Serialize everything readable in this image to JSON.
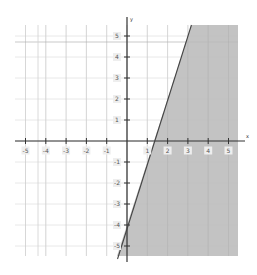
{
  "chart_data": {
    "type": "line",
    "title": "",
    "xlabel": "x",
    "ylabel": "y",
    "xlim": [
      -5.5,
      5.5
    ],
    "ylim": [
      -5.5,
      5.5
    ],
    "grid": true,
    "x_ticks": [
      -5,
      -4,
      -3,
      -2,
      -1,
      1,
      2,
      3,
      4,
      5
    ],
    "y_ticks": [
      5,
      4,
      3,
      2,
      1,
      -1,
      -2,
      -3,
      -4,
      -5
    ],
    "x_tick_labels": [
      "-5",
      "-4",
      "-3",
      "-2",
      "-1",
      "1",
      "2",
      "3",
      "4",
      "5"
    ],
    "y_tick_labels": [
      "5",
      "4",
      "3",
      "2",
      "1",
      "-1",
      "-2",
      "-3",
      "-4",
      "-5"
    ],
    "series": [
      {
        "name": "boundary line",
        "equation": "y = 3x - 4",
        "slope": 3,
        "intercept": -4,
        "style": "solid",
        "points": [
          [
            -0.5,
            -5.5
          ],
          [
            3.17,
            5.5
          ]
        ]
      }
    ],
    "shaded_region": {
      "inequality": "y <= 3x - 4",
      "side": "right/below line",
      "color": "#b8b8b8"
    },
    "legend": null
  },
  "colors": {
    "grid": "#e2e2e2",
    "axis": "#333333",
    "shade": "#b9b9b9",
    "line": "#444444",
    "label_bg": "#eeeeee"
  }
}
